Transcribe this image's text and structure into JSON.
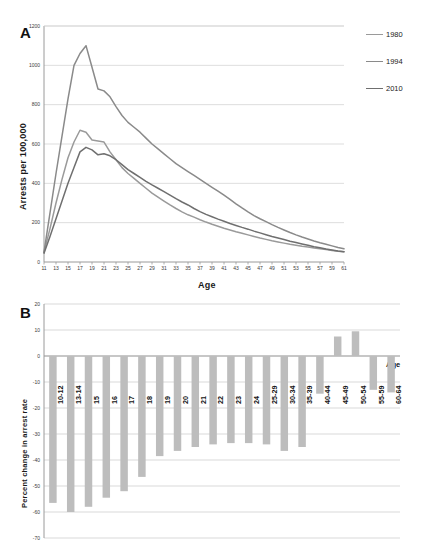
{
  "figure": {
    "panel_a_letter": "A",
    "panel_b_letter": "B"
  },
  "chart_data": [
    {
      "panel": "A",
      "type": "line",
      "title": "",
      "xlabel": "Age",
      "ylabel": "Arrests per 100,000",
      "xlim": [
        11,
        61
      ],
      "ylim": [
        0,
        1200
      ],
      "ytick_labels": [
        "0",
        "200",
        "400",
        "600",
        "800",
        "1000",
        "1200"
      ],
      "yticks": [
        0,
        200,
        400,
        600,
        800,
        1000,
        1200
      ],
      "xtick_labels": [
        "11",
        "13",
        "15",
        "17",
        "19",
        "21",
        "23",
        "25",
        "27",
        "29",
        "31",
        "33",
        "35",
        "37",
        "39",
        "41",
        "43",
        "45",
        "47",
        "49",
        "51",
        "53",
        "55",
        "57",
        "59",
        "61"
      ],
      "xticks": [
        11,
        13,
        15,
        17,
        19,
        21,
        23,
        25,
        27,
        29,
        31,
        33,
        35,
        37,
        39,
        41,
        43,
        45,
        47,
        49,
        51,
        53,
        55,
        57,
        59,
        61
      ],
      "grid": "horizontal",
      "legend_position": "right",
      "x": [
        11,
        12,
        13,
        14,
        15,
        16,
        17,
        18,
        19,
        20,
        21,
        22,
        23,
        24,
        25,
        26,
        27,
        28,
        29,
        30,
        31,
        32,
        33,
        34,
        35,
        36,
        37,
        38,
        39,
        40,
        41,
        42,
        43,
        44,
        45,
        46,
        47,
        48,
        49,
        50,
        51,
        52,
        53,
        54,
        55,
        56,
        57,
        58,
        59,
        60,
        61
      ],
      "series": [
        {
          "name": "1980",
          "color": "#9a9a9a",
          "values": [
            50,
            170,
            300,
            420,
            530,
            610,
            670,
            660,
            620,
            615,
            610,
            560,
            520,
            480,
            450,
            425,
            400,
            375,
            350,
            330,
            310,
            290,
            272,
            255,
            240,
            228,
            215,
            203,
            192,
            182,
            172,
            163,
            154,
            146,
            138,
            130,
            122,
            115,
            108,
            102,
            96,
            90,
            85,
            80,
            76,
            71,
            67,
            63,
            59,
            55,
            52
          ]
        },
        {
          "name": "1994",
          "color": "#8a8a8a",
          "values": [
            50,
            250,
            450,
            640,
            830,
            1000,
            1060,
            1100,
            990,
            880,
            870,
            840,
            790,
            745,
            710,
            685,
            660,
            630,
            600,
            575,
            550,
            525,
            500,
            480,
            460,
            440,
            420,
            400,
            380,
            360,
            340,
            318,
            296,
            275,
            255,
            236,
            220,
            205,
            190,
            176,
            163,
            150,
            138,
            127,
            117,
            107,
            98,
            90,
            82,
            74,
            67
          ]
        },
        {
          "name": "2010",
          "color": "#6f6f6f",
          "values": [
            45,
            130,
            220,
            310,
            400,
            480,
            560,
            583,
            570,
            545,
            550,
            540,
            520,
            495,
            470,
            450,
            430,
            410,
            392,
            375,
            358,
            340,
            322,
            305,
            290,
            272,
            256,
            242,
            230,
            218,
            207,
            196,
            186,
            176,
            167,
            157,
            148,
            139,
            130,
            122,
            114,
            106,
            99,
            92,
            85,
            78,
            72,
            66,
            61,
            56,
            52
          ]
        }
      ]
    },
    {
      "panel": "B",
      "type": "bar",
      "title": "",
      "xlabel": "Age",
      "ylabel": "Percent change in arrest rate",
      "ylim": [
        -70,
        20
      ],
      "ytick_labels": [
        "20",
        "10",
        "0",
        "-10",
        "-20",
        "-30",
        "-40",
        "-50",
        "-60",
        "-70"
      ],
      "yticks": [
        20,
        10,
        0,
        -10,
        -20,
        -30,
        -40,
        -50,
        -60,
        -70
      ],
      "grid": "horizontal",
      "bar_color": "#bdbdbd",
      "categories": [
        "10-12",
        "13-14",
        "15",
        "16",
        "17",
        "18",
        "19",
        "20",
        "21",
        "22",
        "23",
        "24",
        "25-29",
        "30-34",
        "35-39",
        "40-44",
        "45-49",
        "50-54",
        "55-59",
        "60-64"
      ],
      "values": [
        -56.5,
        -60.0,
        -58.0,
        -54.5,
        -52.0,
        -46.5,
        -38.5,
        -36.5,
        -35.0,
        -34.0,
        -33.5,
        -33.5,
        -34.0,
        -36.5,
        -35.0,
        -14.5,
        7.5,
        9.5,
        -13.0,
        -14.0
      ]
    }
  ]
}
